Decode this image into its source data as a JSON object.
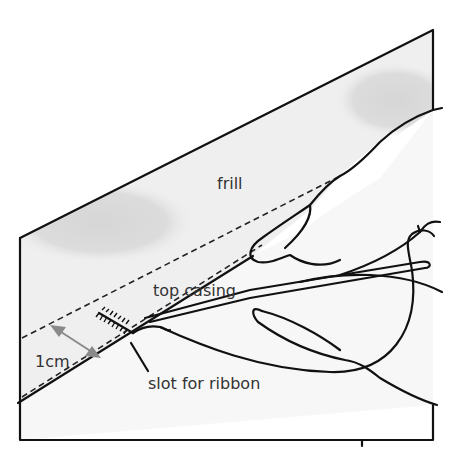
{
  "diagram": {
    "labels": {
      "frill": "frill",
      "top_casing": "top casing",
      "measure": "1cm",
      "slot": "slot for ribbon"
    },
    "colors": {
      "fabric_fill": "#efefef",
      "shading": "#d8d8d8",
      "lower_fabric": "#f7f7f7",
      "ink": "#111111",
      "arrow": "#8a8a8a",
      "text": "#333333"
    }
  }
}
